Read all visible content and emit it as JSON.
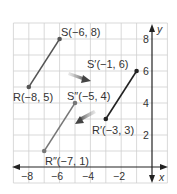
{
  "diagram": {
    "type": "coordinate-plane",
    "axes": {
      "x_label": "x",
      "y_label": "y",
      "x_ticks": [
        "−8",
        "−6",
        "−4",
        "−2"
      ],
      "y_ticks": [
        "8",
        "6",
        "4",
        "2"
      ],
      "x_range": [
        -9,
        1
      ],
      "y_range": [
        -1,
        9
      ]
    },
    "segments": [
      {
        "name": "RS",
        "from": "R",
        "to": "S",
        "color": "#555555"
      },
      {
        "name": "R'S'",
        "from": "R'",
        "to": "S'",
        "color": "#222222"
      },
      {
        "name": "R''S''",
        "from": "R''",
        "to": "S''",
        "color": "#777777"
      }
    ],
    "points": [
      {
        "id": "S",
        "label": "S(−6, 8)",
        "x": -6,
        "y": 8
      },
      {
        "id": "R",
        "label": "R(−8, 5)",
        "x": -8,
        "y": 5
      },
      {
        "id": "S'",
        "label": "S′(−1, 6)",
        "x": -1,
        "y": 6
      },
      {
        "id": "R'",
        "label": "R′(−3, 3)",
        "x": -3,
        "y": 3
      },
      {
        "id": "S''",
        "label": "S″(−5, 4)",
        "x": -5,
        "y": 4
      },
      {
        "id": "R''",
        "label": "R″(−7, 1)",
        "x": -7,
        "y": 1
      }
    ],
    "arrows": [
      {
        "name": "translation-arrow-1",
        "direction": "down-right"
      },
      {
        "name": "translation-arrow-2",
        "direction": "down-left"
      }
    ],
    "colors": {
      "grid": "#c8c8c8",
      "axis": "#222222",
      "point": "#444444",
      "arrow": "#555555"
    }
  }
}
